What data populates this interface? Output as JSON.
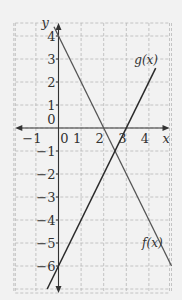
{
  "chart_data": {
    "type": "line",
    "title": "",
    "xlabel": "x",
    "ylabel": "y",
    "xlim": [
      -2,
      5
    ],
    "ylim": [
      -7,
      5
    ],
    "grid": true,
    "x_ticks": [
      {
        "value": -1,
        "label": "−1"
      },
      {
        "value": 0,
        "label": "0"
      },
      {
        "value": 1,
        "label": "1"
      },
      {
        "value": 2,
        "label": "2"
      },
      {
        "value": 3,
        "label": "3"
      },
      {
        "value": 4,
        "label": "4"
      }
    ],
    "y_ticks": [
      {
        "value": 4,
        "label": "4"
      },
      {
        "value": 3,
        "label": "3"
      },
      {
        "value": 2,
        "label": "2"
      },
      {
        "value": 1,
        "label": "1"
      },
      {
        "value": 0,
        "label": "0"
      },
      {
        "value": -1,
        "label": "−1"
      },
      {
        "value": -2,
        "label": "−2"
      },
      {
        "value": -3,
        "label": "−3"
      },
      {
        "value": -4,
        "label": "−4"
      },
      {
        "value": -5,
        "label": "−5"
      },
      {
        "value": -6,
        "label": "−6"
      }
    ],
    "series": [
      {
        "name": "f(x)",
        "label": "f(x)",
        "slope": -2,
        "intercept": 4,
        "x": [
          -0.2,
          5
        ],
        "y": [
          4.4,
          -6
        ]
      },
      {
        "name": "g(x)",
        "label": "g(x)",
        "slope": 2,
        "intercept": -6,
        "x": [
          -0.5,
          4.3
        ],
        "y": [
          -7,
          2.6
        ]
      }
    ],
    "intersection": {
      "x": 2.5,
      "y": -1
    }
  }
}
